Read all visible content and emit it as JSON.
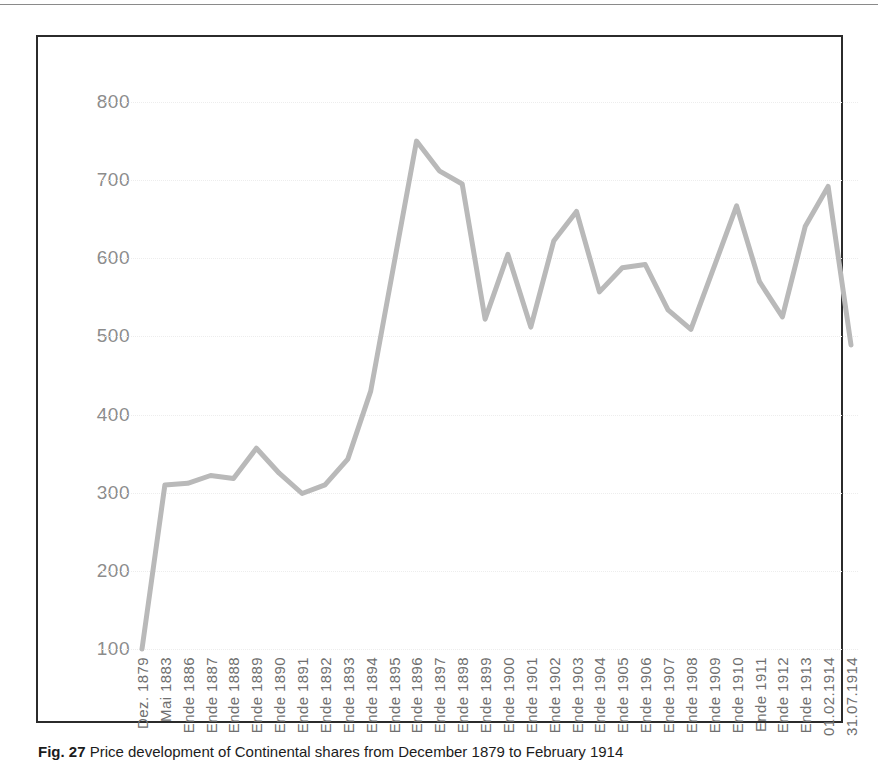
{
  "figure": {
    "caption_label": "Fig. 27",
    "caption_text": "Price development of Continental shares from December 1879 to February 1914"
  },
  "colors": {
    "line": "#b9b9b9",
    "frame": "#2b2b2b",
    "gridline": "#ededed",
    "y_label": "#8c8c8c",
    "x_label": "#6f6f6f",
    "background": "#ffffff"
  },
  "chart_data": {
    "type": "line",
    "title": "",
    "xlabel": "",
    "ylabel": "",
    "ylim": [
      100,
      800
    ],
    "y_ticks": [
      800,
      700,
      600,
      500,
      400,
      300,
      200,
      100
    ],
    "grid": true,
    "legend": null,
    "categories": [
      "Dez. 1879",
      "Mai 1883",
      "Ende 1886",
      "Ende 1887",
      "Ende 1888",
      "Ende 1889",
      "Ende 1890",
      "Ende 1891",
      "Ende 1892",
      "Ende 1893",
      "Ende 1894",
      "Ende 1895",
      "Ende 1896",
      "Ende 1897",
      "Ende 1898",
      "Ende 1899",
      "Ende 1900",
      "Ende 1901",
      "Ende 1902",
      "Ende 1903",
      "Ende 1904",
      "Ende 1905",
      "Ende 1906",
      "Ende 1907",
      "Ende 1908",
      "Ende 1909",
      "Ende 1910",
      "Ende 1911",
      "Ende 1912",
      "Ende 1913",
      "01.02.1914",
      "31.07.1914"
    ],
    "values": [
      100,
      310,
      312,
      322,
      318,
      357,
      325,
      299,
      310,
      343,
      430,
      590,
      750,
      712,
      695,
      522,
      605,
      512,
      622,
      660,
      557,
      588,
      592,
      534,
      509,
      588,
      667,
      570,
      525,
      641,
      692,
      489
    ]
  }
}
